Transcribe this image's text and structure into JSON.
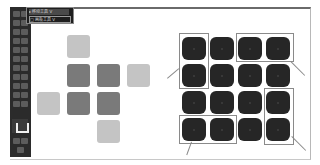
{
  "window": {
    "type": "image-editor-canvas-screenshot"
  },
  "toolbar": {
    "tool_count": 22,
    "flyout": {
      "items": [
        {
          "label": "▸ 移动工具  V",
          "state": "active"
        },
        {
          "label": "□ 画板工具  V",
          "state": "hover"
        }
      ]
    },
    "icons": [
      "move-icon",
      "marquee-icon",
      "lasso-icon",
      "quick-select-icon",
      "crop-icon",
      "eyedropper-icon",
      "healing-icon",
      "brush-icon",
      "stamp-icon",
      "history-brush-icon",
      "eraser-icon",
      "gradient-icon",
      "blur-icon",
      "dodge-icon",
      "pen-icon",
      "type-icon",
      "path-select-icon",
      "shape-icon",
      "hand-icon",
      "zoom-icon",
      "edit-toolbar-icon",
      "quick-mask-icon"
    ],
    "swatches": {
      "foreground": "#3a3a3a",
      "background": "#f0f0f0"
    }
  },
  "canvas": {
    "left_pattern": {
      "light_color": "#c4c4c4",
      "mid_color": "#7a7a7a",
      "squares": [
        {
          "row": 0,
          "col": 1,
          "tone": "light"
        },
        {
          "row": 1,
          "col": 1,
          "tone": "mid"
        },
        {
          "row": 1,
          "col": 2,
          "tone": "mid"
        },
        {
          "row": 1,
          "col": 3,
          "tone": "light"
        },
        {
          "row": 2,
          "col": 0,
          "tone": "light"
        },
        {
          "row": 2,
          "col": 1,
          "tone": "mid"
        },
        {
          "row": 2,
          "col": 2,
          "tone": "mid"
        },
        {
          "row": 3,
          "col": 2,
          "tone": "light"
        }
      ]
    },
    "right_grid": {
      "rows": 4,
      "cols": 4,
      "tile_color": "#262626",
      "selections": [
        {
          "name": "left-column-top-two",
          "rows": [
            0,
            1
          ],
          "cols": [
            0
          ]
        },
        {
          "name": "top-row-right-two",
          "rows": [
            0
          ],
          "cols": [
            2,
            3
          ]
        },
        {
          "name": "bottom-row-left-two",
          "rows": [
            3
          ],
          "cols": [
            0,
            1
          ]
        },
        {
          "name": "right-column-bottom-two",
          "rows": [
            2,
            3
          ],
          "cols": [
            3
          ]
        }
      ],
      "selection_color": "#8a8a8a"
    }
  }
}
